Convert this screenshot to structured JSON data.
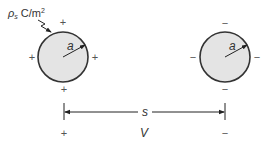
{
  "diagram": {
    "charge_label": {
      "symbol": "ρ",
      "subscript": "s",
      "unit": " C/m",
      "unit_exp": "2"
    },
    "left_sphere": {
      "radius_label": "a",
      "signs": {
        "top": "+",
        "left": "+",
        "right": "+",
        "bottom": "+"
      },
      "fill": "#e4e4e4",
      "stroke": "#333333"
    },
    "right_sphere": {
      "radius_label": "a",
      "signs": {
        "top": "−",
        "left": "−",
        "right": "−",
        "bottom": "−"
      },
      "fill": "#e4e4e4",
      "stroke": "#333333"
    },
    "separation": {
      "label": "s"
    },
    "voltage": {
      "label": "V",
      "positive_terminal": "+",
      "negative_terminal": "−"
    }
  }
}
